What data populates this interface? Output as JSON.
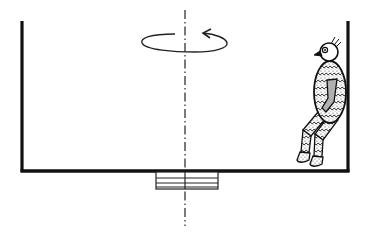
{
  "diagram": {
    "colors": {
      "line": "#111111",
      "background": "#ffffff",
      "figure_fill": "#f2f2f2",
      "arm_fill": "#b0b0b0"
    },
    "elements": {
      "container": "open-top container (walls and floor)",
      "axis": "dash-dot rotation axis",
      "rotation": "counter-clockwise rotation arrow (ellipse)",
      "base": "bearing / pivot block under floor",
      "figure": "seated figure against right wall"
    }
  }
}
